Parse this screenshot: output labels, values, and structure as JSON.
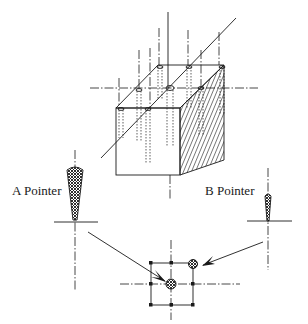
{
  "figure": {
    "type": "technical-illustration",
    "labels": {
      "a_pointer": "A Pointer",
      "b_pointer": "B Pointer"
    },
    "colors": {
      "ink": "#1a1a1a",
      "background": "#ffffff"
    }
  }
}
